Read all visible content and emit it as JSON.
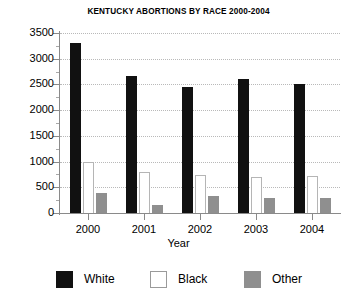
{
  "chart_data": {
    "type": "bar",
    "title": "KENTUCKY ABORTIONS BY RACE 2000-2004",
    "xlabel": "Year",
    "ylabel": "",
    "categories": [
      "2000",
      "2001",
      "2002",
      "2003",
      "2004"
    ],
    "series": [
      {
        "name": "White",
        "color": "#111111",
        "values": [
          3300,
          2670,
          2460,
          2600,
          2500
        ]
      },
      {
        "name": "Black",
        "color": "#ffffff",
        "values": [
          1000,
          790,
          740,
          700,
          720
        ]
      },
      {
        "name": "Other",
        "color": "#8f8f8f",
        "values": [
          390,
          160,
          330,
          290,
          300
        ]
      }
    ],
    "ylim": [
      0,
      3500
    ],
    "ytick_labels": [
      "0",
      "500",
      "1000",
      "1500",
      "2000",
      "2500",
      "3000",
      "3500"
    ],
    "ytick_values": [
      0,
      500,
      1000,
      1500,
      2000,
      2500,
      3000,
      3500
    ],
    "grid": true,
    "grid_style": "dotted",
    "legend_position": "bottom",
    "legend": [
      "White",
      "Black",
      "Other"
    ]
  }
}
